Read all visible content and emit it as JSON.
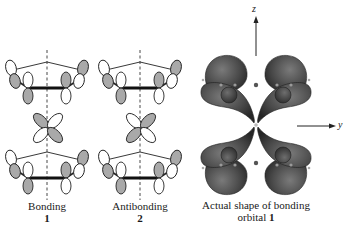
{
  "figure": {
    "panels": [
      {
        "id": "bonding",
        "caption": "Bonding",
        "number": "1",
        "center_orbital_phase": "gray lobes upper-left and lower-right"
      },
      {
        "id": "antibonding",
        "caption": "Antibonding",
        "number": "2",
        "center_orbital_phase": "gray lobes upper-right and lower-left"
      },
      {
        "id": "actual-shape",
        "caption_line1": "Actual shape of bonding",
        "caption_line2": "orbital",
        "number": "1",
        "axes": {
          "vertical": "z",
          "horizontal": "y"
        }
      }
    ],
    "colors": {
      "shaded_lobe": "#a9a9a9",
      "open_lobe": "#ffffff",
      "outline": "#222222",
      "surface_dark": "#3a3a3a",
      "surface_mid": "#5e5e5e"
    }
  }
}
